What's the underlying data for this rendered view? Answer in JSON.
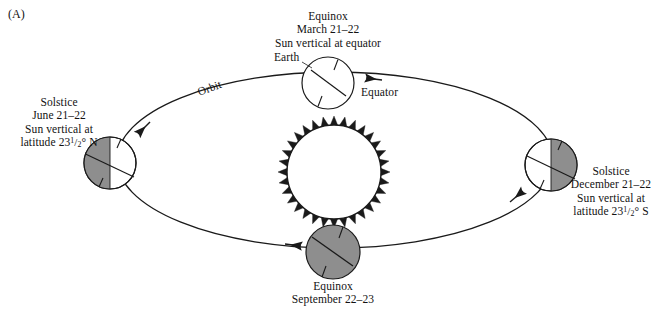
{
  "figure": {
    "panel_tag": "(A)",
    "width": 670,
    "height": 311,
    "background_color": "#ffffff"
  },
  "colors": {
    "stroke": "#1a1a1a",
    "earth_shadow_gray": "#8e8e8e",
    "earth_lit_white": "#ffffff",
    "text": "#121212",
    "sun_outline": "#1a1a1a"
  },
  "orbit": {
    "label": "Orbit",
    "direction": "counterclockwise",
    "center_x": 335,
    "center_y": 160,
    "radius_x": 218,
    "radius_y": 88,
    "arrow_count": 4
  },
  "sun": {
    "name": "sun",
    "center_x": 334,
    "center_y": 172,
    "radius": 47,
    "ray_count": 32,
    "ray_length": 9
  },
  "positions": [
    {
      "key": "march",
      "name": "earth-march-equinox",
      "center_x": 328,
      "center_y": 83,
      "radius": 26,
      "shaded": "none",
      "label_align": "center",
      "label_x": 328,
      "label_y": 10,
      "lines": [
        "Equinox",
        "March 21–22",
        "Sun vertical at equator"
      ],
      "extra_labels": [
        {
          "name": "earth-callout",
          "text": "Earth",
          "x": 272,
          "y": 57
        },
        {
          "name": "equator-callout",
          "text": "Equator",
          "x": 364,
          "y": 88
        }
      ]
    },
    {
      "key": "june",
      "name": "earth-june-solstice",
      "center_x": 110,
      "center_y": 163,
      "radius": 26,
      "shaded": "left",
      "label_align": "center",
      "label_x": 60,
      "label_y": 96,
      "lines": [
        "Solstice",
        "June 21–22",
        "Sun vertical at",
        "latitude 23½° N"
      ],
      "latitude_value": "23",
      "latitude_fraction_numerator": "1",
      "latitude_fraction_denominator": "2",
      "latitude_hemisphere": "N",
      "extra_labels": []
    },
    {
      "key": "september",
      "name": "earth-september-equinox",
      "center_x": 333,
      "center_y": 252,
      "radius": 27,
      "shaded": "full",
      "label_align": "center",
      "label_x": 333,
      "label_y": 282,
      "lines": [
        "Equinox",
        "September 22–23"
      ],
      "extra_labels": []
    },
    {
      "key": "december",
      "name": "earth-december-solstice",
      "center_x": 551,
      "center_y": 165,
      "radius": 26,
      "shaded": "right",
      "label_align": "center",
      "label_x": 620,
      "label_y": 167,
      "lines": [
        "Solstice",
        "December 21–22",
        "Sun vertical at",
        "latitude 23½° S"
      ],
      "latitude_value": "23",
      "latitude_fraction_numerator": "1",
      "latitude_fraction_denominator": "2",
      "latitude_hemisphere": "S",
      "extra_labels": []
    }
  ],
  "text": {
    "march": {
      "line1": "Equinox",
      "line2": "March 21–22",
      "line3": "Sun vertical at equator"
    },
    "june": {
      "line1": "Solstice",
      "line2": "June 21–22",
      "line3": "Sun vertical at",
      "line4_prefix": "latitude 23",
      "line4_num": "1",
      "line4_slash": "/",
      "line4_den": "2",
      "line4_suffix": "° N"
    },
    "september": {
      "line1": "Equinox",
      "line2": "September 22–23"
    },
    "december": {
      "line1": "Solstice",
      "line2": "December 21–22",
      "line3": "Sun vertical at",
      "line4_prefix": "latitude 23",
      "line4_num": "1",
      "line4_slash": "/",
      "line4_den": "2",
      "line4_suffix": "° S"
    },
    "earth_callout": "Earth",
    "equator_callout": "Equator",
    "orbit_callout": "Orbit",
    "panel_tag": "(A)"
  }
}
